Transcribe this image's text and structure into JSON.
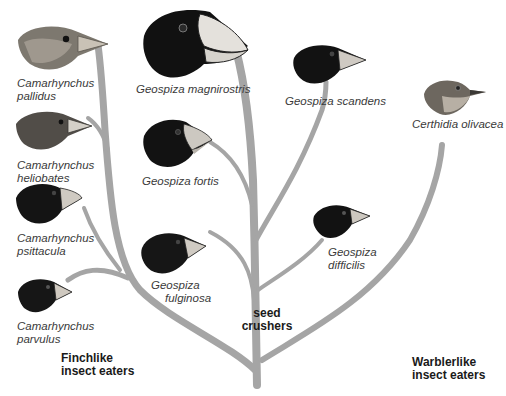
{
  "diagram": {
    "type": "phylogenetic-tree",
    "branch_color": "#a5a5a5",
    "species": [
      {
        "id": "pallidus",
        "genus": "Camarhynchus",
        "epithet": "pallidus",
        "line1": "Camarhynchus",
        "line2": "pallidus",
        "head_color": "#6e6a64",
        "plumage": "streaked-brown"
      },
      {
        "id": "heliobates",
        "genus": "Camarhynchus",
        "epithet": "heliobates",
        "line1": "Camarhynchus",
        "line2": "heliobates",
        "head_color": "#4b4845",
        "plumage": "brown-grey"
      },
      {
        "id": "psittacula",
        "genus": "Camarhynchus",
        "epithet": "psittacula",
        "line1": "Camarhynchus",
        "line2": "psittacula",
        "head_color": "#141414",
        "plumage": "black"
      },
      {
        "id": "parvulus",
        "genus": "Camarhynchus",
        "epithet": "parvulus",
        "line1": "Camarhynchus",
        "line2": "parvulus",
        "head_color": "#161616",
        "plumage": "black"
      },
      {
        "id": "magnirostris",
        "genus": "Geospiza",
        "epithet": "magnirostris",
        "line1": "Geospiza magnirostris",
        "head_color": "#111111",
        "plumage": "black"
      },
      {
        "id": "fortis",
        "genus": "Geospiza",
        "epithet": "fortis",
        "line1": "Geospiza fortis",
        "head_color": "#121212",
        "plumage": "black"
      },
      {
        "id": "fulginosa",
        "genus": "Geospiza",
        "epithet": "fulginosa",
        "line1": "Geospiza",
        "line2": "fulginosa",
        "head_color": "#161616",
        "plumage": "black"
      },
      {
        "id": "scandens",
        "genus": "Geospiza",
        "epithet": "scandens",
        "line1": "Geospiza scandens",
        "head_color": "#121212",
        "plumage": "black"
      },
      {
        "id": "difficilis",
        "genus": "Geospiza",
        "epithet": "difficilis",
        "line1": "Geospiza",
        "line2": "difficilis",
        "head_color": "#121212",
        "plumage": "black"
      },
      {
        "id": "olivacea",
        "genus": "Certhidia",
        "epithet": "olivacea",
        "line1": "Certhidia olivacea",
        "head_color": "#6a645c",
        "plumage": "olive-grey"
      }
    ],
    "groups": [
      {
        "id": "finchlike",
        "line1": "Finchlike",
        "line2": "insect eaters"
      },
      {
        "id": "seed",
        "line1": "seed",
        "line2": "crushers"
      },
      {
        "id": "warblerlike",
        "line1": "Warblerlike",
        "line2": "insect eaters"
      }
    ]
  }
}
